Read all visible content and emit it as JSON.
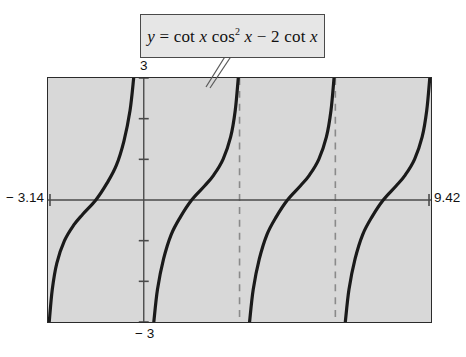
{
  "figure": {
    "kind": "graphing-calculator-plot",
    "equation_label": {
      "lhs": "y",
      "equals": "=",
      "rhs_plain": "cot x cos² x − 2 cot x",
      "full_plain": "y = cot x cos² x − 2 cot x",
      "tok_cot1": "cot",
      "tok_x1": "x",
      "tok_cos": "cos",
      "tok_exp": "2",
      "tok_x2": "x",
      "tok_minus": "−",
      "tok_two": "2",
      "tok_cot2": "cot",
      "tok_x3": "x"
    },
    "axis_labels": {
      "xmin": "− 3.14",
      "xmax": "9.42",
      "ymax": "3",
      "ymin": "− 3"
    },
    "colors": {
      "plot_background": "#d8d8d8",
      "page_background": "#ffffff",
      "curve": "#1a1a1a",
      "axis": "#4a4a4a",
      "frame": "#2b2b2b",
      "callout_background": "#e6e6e6",
      "callout_border": "#4a4a4a",
      "asymptote_dash": "#8a8a8a"
    }
  },
  "chart_data": {
    "type": "line",
    "xlabel": "",
    "ylabel": "",
    "xlim": [
      -3.14,
      9.42
    ],
    "ylim": [
      -3,
      3
    ],
    "grid": false,
    "legend": "none",
    "x_tick_labels": [
      "− 3.14",
      "9.42"
    ],
    "y_tick_labels": [
      "3",
      "− 3"
    ],
    "y_axis_position_x": 0,
    "y_tick_spacing": 1,
    "x_axis_line_y": 0,
    "asymptotes": {
      "style": "dashed-vertical",
      "drawn_x": [
        3.14159,
        6.28319
      ],
      "all_x": [
        -3.14159,
        0,
        3.14159,
        6.28319,
        9.42478
      ]
    },
    "series": [
      {
        "name": "branch-1",
        "x_domain": [
          -3.14159,
          0
        ],
        "points": [
          {
            "x": -3.1,
            "y": -3.0
          },
          {
            "x": -3.0,
            "y": -2.2
          },
          {
            "x": -2.85,
            "y": -1.55
          },
          {
            "x": -2.6,
            "y": -1.0
          },
          {
            "x": -2.3,
            "y": -0.62
          },
          {
            "x": -2.0,
            "y": -0.35
          },
          {
            "x": -1.5708,
            "y": 0.0
          },
          {
            "x": -1.2,
            "y": 0.42
          },
          {
            "x": -0.9,
            "y": 0.85
          },
          {
            "x": -0.65,
            "y": 1.45
          },
          {
            "x": -0.45,
            "y": 2.2
          },
          {
            "x": -0.33,
            "y": 3.0
          }
        ]
      },
      {
        "name": "branch-2",
        "x_domain": [
          0,
          3.14159
        ],
        "points": [
          {
            "x": 0.33,
            "y": -3.0
          },
          {
            "x": 0.45,
            "y": -2.2
          },
          {
            "x": 0.65,
            "y": -1.45
          },
          {
            "x": 0.9,
            "y": -0.85
          },
          {
            "x": 1.2,
            "y": -0.42
          },
          {
            "x": 1.5708,
            "y": 0.0
          },
          {
            "x": 2.0,
            "y": 0.35
          },
          {
            "x": 2.3,
            "y": 0.62
          },
          {
            "x": 2.6,
            "y": 1.0
          },
          {
            "x": 2.85,
            "y": 1.55
          },
          {
            "x": 3.0,
            "y": 2.2
          },
          {
            "x": 3.1,
            "y": 3.0
          }
        ]
      },
      {
        "name": "branch-3",
        "x_domain": [
          3.14159,
          6.28319
        ],
        "points": [
          {
            "x": 3.47,
            "y": -3.0
          },
          {
            "x": 3.59,
            "y": -2.2
          },
          {
            "x": 3.79,
            "y": -1.45
          },
          {
            "x": 4.04,
            "y": -0.85
          },
          {
            "x": 4.34,
            "y": -0.42
          },
          {
            "x": 4.7124,
            "y": 0.0
          },
          {
            "x": 5.14,
            "y": 0.35
          },
          {
            "x": 5.44,
            "y": 0.62
          },
          {
            "x": 5.74,
            "y": 1.0
          },
          {
            "x": 5.99,
            "y": 1.55
          },
          {
            "x": 6.14,
            "y": 2.2
          },
          {
            "x": 6.24,
            "y": 3.0
          }
        ]
      },
      {
        "name": "branch-4",
        "x_domain": [
          6.28319,
          9.42478
        ],
        "points": [
          {
            "x": 6.61,
            "y": -3.0
          },
          {
            "x": 6.73,
            "y": -2.2
          },
          {
            "x": 6.93,
            "y": -1.45
          },
          {
            "x": 7.18,
            "y": -0.85
          },
          {
            "x": 7.48,
            "y": -0.42
          },
          {
            "x": 7.854,
            "y": 0.0
          },
          {
            "x": 8.28,
            "y": 0.35
          },
          {
            "x": 8.58,
            "y": 0.62
          },
          {
            "x": 8.88,
            "y": 1.0
          },
          {
            "x": 9.13,
            "y": 1.55
          },
          {
            "x": 9.28,
            "y": 2.2
          },
          {
            "x": 9.38,
            "y": 3.0
          }
        ]
      }
    ]
  }
}
